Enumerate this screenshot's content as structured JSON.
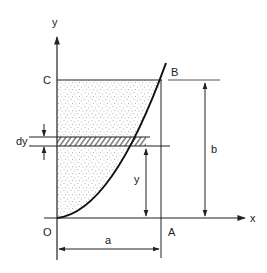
{
  "diagram": {
    "type": "area-under-parabola",
    "labels": {
      "y_axis": "y",
      "x_axis": "x",
      "origin": "O",
      "point_a": "A",
      "point_b": "B",
      "point_c": "C",
      "dim_a": "a",
      "dim_b": "b",
      "dim_y": "y",
      "dim_dy": "dy"
    },
    "colors": {
      "line": "#222222",
      "stipple": "#555555",
      "background": "#ffffff"
    }
  }
}
